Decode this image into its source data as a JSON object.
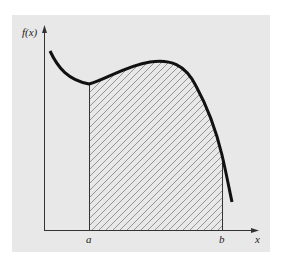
{
  "figure": {
    "type": "definite-integral-area-diagram",
    "y_axis_label": "f(x)",
    "x_axis_label": "x",
    "lower_limit_label": "a",
    "upper_limit_label": "b",
    "shaded_region": "area under f(x) between a and b (hatched)",
    "colors": {
      "panel_background": "#e8e8e8",
      "curve": "#111111",
      "axes": "#333333",
      "hatch": "#8a8a8a"
    }
  }
}
